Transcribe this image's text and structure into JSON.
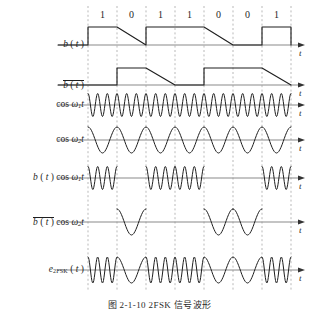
{
  "figure": {
    "caption": "图 2-1-10  2FSK 信号波形",
    "axis_label": "t",
    "bit_sequence": [
      "1",
      "0",
      "1",
      "1",
      "0",
      "0",
      "1"
    ],
    "colors": {
      "wave": "#1f1f1f",
      "axis": "#8a8a8a",
      "gridline": "#9b9b9b",
      "text": "#1f1f1f"
    }
  },
  "rows": [
    {
      "id": "b-of-t",
      "name": "b(t)",
      "kind": "square",
      "invert": false,
      "label_html": "b ( t )"
    },
    {
      "id": "b-bar-of-t",
      "name": "b̅(t)",
      "kind": "square",
      "invert": true,
      "label_html": "b ( t )"
    },
    {
      "id": "cos-w1t",
      "name": "cos ω1t",
      "kind": "carrier",
      "freq": "w1",
      "label_html": "cos ω1t"
    },
    {
      "id": "cos-w2t",
      "name": "cos ω2t",
      "kind": "carrier",
      "freq": "w2",
      "label_html": "cos ω2t"
    },
    {
      "id": "b-cos-w1t",
      "name": "b(t) cos ω1t",
      "kind": "gated",
      "freq": "w1",
      "invert": false,
      "label_html": "b ( t ) cos ω1t"
    },
    {
      "id": "bbar-cos-w2t",
      "name": "b̅(t) cos ω2t",
      "kind": "gated",
      "freq": "w2",
      "invert": true,
      "label_html": "b ( t ) cos ω2t"
    },
    {
      "id": "e2fsk-of-t",
      "name": "e2FSK(t)",
      "kind": "fsk",
      "label_html": "e2FSK ( t )"
    }
  ],
  "chart_data": {
    "type": "line",
    "title": "图 2-1-10  2FSK 信号波形",
    "xlabel": "t",
    "ylabel": "",
    "grid": true,
    "legend": "none",
    "bits": [
      1,
      0,
      1,
      1,
      0,
      0,
      1
    ],
    "bit_labels": [
      "1",
      "0",
      "1",
      "1",
      "0",
      "0",
      "1"
    ],
    "bit_period_px": 29,
    "x_start_px": 88,
    "x_end_px": 291,
    "carrier_cycles_per_bit": {
      "w1": 3,
      "w2": 1
    },
    "series": [
      {
        "name": "b ( t )",
        "type": "square",
        "values": [
          1,
          0,
          1,
          1,
          0,
          0,
          1
        ]
      },
      {
        "name": "b̅ ( t )",
        "type": "square",
        "values": [
          0,
          1,
          0,
          0,
          1,
          1,
          0
        ]
      },
      {
        "name": "cos ω1t",
        "type": "sinusoid",
        "cycles_per_bit": 3,
        "continuous": true
      },
      {
        "name": "cos ω2t",
        "type": "sinusoid",
        "cycles_per_bit": 1,
        "continuous": true
      },
      {
        "name": "b ( t ) cos ω1t",
        "type": "gated-sinusoid",
        "cycles_per_bit": 3,
        "gate": [
          1,
          0,
          1,
          1,
          0,
          0,
          1
        ]
      },
      {
        "name": "b̅ ( t ) cos ω2t",
        "type": "gated-sinusoid",
        "cycles_per_bit": 1,
        "gate": [
          0,
          1,
          0,
          0,
          1,
          1,
          0
        ]
      },
      {
        "name": "e2FSK ( t )",
        "type": "fsk-sum",
        "cycles_per_bit_high": 3,
        "cycles_per_bit_low": 1,
        "bits": [
          1,
          0,
          1,
          1,
          0,
          0,
          1
        ]
      }
    ]
  },
  "layout": {
    "row_baselines": [
      45,
      85,
      105,
      140,
      178,
      222,
      270
    ],
    "bit_label_y": 10,
    "label_right_x": 84,
    "axis_arrow_x": 305
  }
}
